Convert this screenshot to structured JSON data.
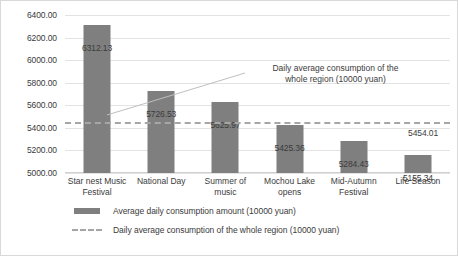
{
  "chart_data": {
    "type": "bar",
    "title": "",
    "xlabel": "",
    "ylabel": "",
    "ylim": [
      5000,
      6400
    ],
    "ytick_step": 200,
    "grid": true,
    "legend_position": "bottom",
    "categories": [
      "Star nest Music Festival",
      "National Day",
      "Summer of music",
      "Mochou Lake opens",
      "Mid-Autumn Festival",
      "Life Season"
    ],
    "ytick_labels": [
      "6400.00",
      "6200.00",
      "6000.00",
      "5800.00",
      "5600.00",
      "5400.00",
      "5200.00",
      "5000.00"
    ],
    "ytick_values": [
      6400,
      6200,
      6000,
      5800,
      5600,
      5400,
      5200,
      5000
    ],
    "series": [
      {
        "name": "Average daily consumption amount (10000 yuan)",
        "type": "bar",
        "color": "#7f7f7f",
        "values": [
          6312.13,
          5726.53,
          5625.97,
          5425.36,
          5284.43,
          5155.34
        ],
        "data_labels": [
          "6312.13",
          "5726.53",
          "5625.97",
          "5425.36",
          "5284.43",
          "5155.34"
        ]
      },
      {
        "name": "Daily average consumption of the whole region (10000 yuan)",
        "type": "line",
        "style": "dashed",
        "color": "#a6a6a6",
        "constant_value": 5454.01,
        "data_label": "5454.01"
      }
    ],
    "annotations": [
      {
        "text_line1": "Daily average consumption of the",
        "text_line2": "whole region (10000 yuan)",
        "has_leader_line": true
      }
    ],
    "legend": [
      {
        "label": "Average daily consumption amount (10000 yuan)",
        "marker": "solid-rect",
        "color": "#7f7f7f"
      },
      {
        "label": "Daily average consumption of the whole region (10000 yuan)",
        "marker": "dashed-line",
        "color": "#a6a6a6"
      }
    ]
  },
  "categories_wrapped": [
    [
      "Star nest Music",
      "Festival"
    ],
    [
      "National Day",
      ""
    ],
    [
      "Summer of",
      "music"
    ],
    [
      "Mochou Lake",
      "opens"
    ],
    [
      "Mid-Autumn",
      "Festival"
    ],
    [
      "Life Season",
      ""
    ]
  ]
}
